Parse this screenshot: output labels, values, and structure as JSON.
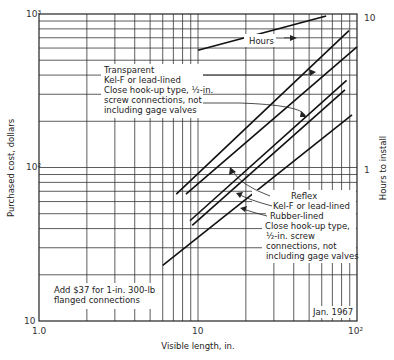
{
  "chart_data": {
    "type": "line",
    "title": "",
    "xlabel": "Visible length, in.",
    "ylabel": "Purchased cost, dollars",
    "y2label": "Hours to install",
    "xscale": "log",
    "yscale": "log",
    "xlim": [
      1.0,
      100
    ],
    "ylim": [
      10,
      1000
    ],
    "y2lim": [
      0.1,
      10
    ],
    "x_ticks": [
      "1.0",
      "10",
      "10²"
    ],
    "y_ticks": [
      "10",
      "10²",
      "10³"
    ],
    "y2_ticks": [
      "1",
      "10"
    ],
    "grid": true,
    "series": [
      {
        "name": "Transparent, Kel-F or lead-lined",
        "group": "Transparent",
        "x": [
          7.3,
          89
        ],
        "y": [
          67,
          780
        ]
      },
      {
        "name": "Transparent, Close hook-up type, 1/2-in. screw connections, not including gage valves",
        "group": "Transparent",
        "x": [
          8.4,
          100
        ],
        "y": [
          67,
          610
        ]
      },
      {
        "name": "Reflex, Kel-F or lead-lined",
        "group": "Reflex",
        "x": [
          8.9,
          86
        ],
        "y": [
          45,
          370
        ]
      },
      {
        "name": "Reflex, Rubber-lined",
        "group": "Reflex",
        "x": [
          9.2,
          84
        ],
        "y": [
          42,
          320
        ]
      },
      {
        "name": "Reflex, Close hook-up type, 1/2-in. screw connections, not including gage valves",
        "group": "Reflex",
        "x": [
          6.0,
          93
        ],
        "y": [
          23,
          220
        ]
      },
      {
        "name": "Hours",
        "axis": "y2",
        "x": [
          10,
          64
        ],
        "y": [
          5.8,
          9.7
        ]
      }
    ],
    "annotations": [
      "Transparent",
      "Kel-F or lead-lined",
      "Close hook-up type, 1/2-in.",
      "screw connections, not",
      "including gage valves",
      "Hours",
      "Reflex",
      "Kel-F or lead-lined",
      "Rubber-lined",
      "Close hook-up type,",
      "1/2-in. screw",
      "connections, not",
      "including gage valves",
      "Add $37 for 1-in. 300-lb",
      "flanged connections",
      "Jan. 1967"
    ]
  },
  "labels": {
    "xlabel": "Visible length, in.",
    "ylabel": "Purchased cost, dollars",
    "y2label": "Hours to install",
    "x_tick_1": "1.0",
    "x_tick_10": "10",
    "x_tick_100": "10²",
    "y_tick_10": "10",
    "y_tick_100": "10²",
    "y_tick_1000": "10³",
    "y2_tick_1": "1",
    "y2_tick_10": "10",
    "hours": "Hours",
    "transparent": [
      "Transparent",
      "Kel-F or lead-lined",
      "Close hook-up type, ½-in.",
      "screw connections, not",
      "including gage valves"
    ],
    "reflex": [
      "Reflex",
      "Kel-F or lead-lined",
      "Rubber-lined",
      "Close hook-up type,",
      "½-in. screw",
      "connections, not",
      "including gage valves"
    ],
    "note": [
      "Add $37 for 1-in. 300-lb",
      "flanged connections"
    ],
    "date": "Jan. 1967"
  }
}
